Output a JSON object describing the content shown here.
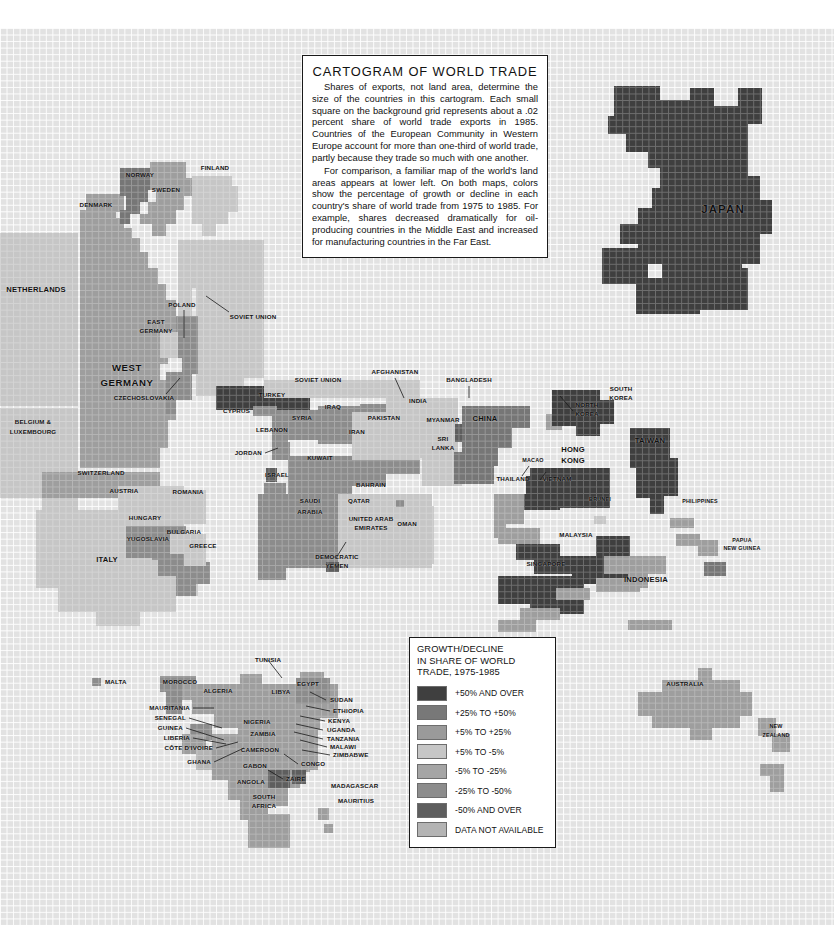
{
  "figure": {
    "kind": "cartogram",
    "background_color": "#c9c9c9",
    "grid_line_color": "#ffffff"
  },
  "description": {
    "title": "CARTOGRAM OF WORLD TRADE",
    "paragraphs": [
      "Shares of exports, not land area, determine the size of the countries in this cartogram. Each small square on the background grid represents about a .02 percent share of world trade exports in 1985. Countries of the European Community in Western Europe account for more than one-third of world trade, partly because they trade so much with one another.",
      "For comparison, a familiar map of the world's land areas appears at lower left. On both maps, colors show the percentage of growth or decline in each country's share of world trade from 1975 to 1985. For example, shares decreased dramatically for oil-producing countries in the Middle East and increased for manufacturing countries in the Far East."
    ]
  },
  "legend": {
    "title_lines": [
      "GROWTH/DECLINE",
      "IN SHARE OF WORLD",
      "TRADE, 1975-1985"
    ],
    "items": [
      {
        "label": "+50% AND OVER",
        "color": "#3f3f3f"
      },
      {
        "label": "+25% TO +50%",
        "color": "#787878"
      },
      {
        "label": "+5% TO +25%",
        "color": "#9a9a9a"
      },
      {
        "label": "+5% TO -5%",
        "color": "#c6c6c6"
      },
      {
        "label": "-5% TO -25%",
        "color": "#a5a5a5"
      },
      {
        "label": "-25% TO -50%",
        "color": "#8c8c8c"
      },
      {
        "label": "-50% AND OVER",
        "color": "#5e5e5e"
      },
      {
        "label": "DATA NOT AVAILABLE",
        "color": "#b4b4b4"
      }
    ]
  },
  "chart_data": {
    "type": "cartogram",
    "title": "CARTOGRAM OF WORLD TRADE",
    "units": "one background grid square ≈ .02 percent share of world trade exports, 1985",
    "period": "1975-1985",
    "legend_position": "center-bottom",
    "classes": [
      "+50% AND OVER",
      "+25% TO +50%",
      "+5% TO +25%",
      "+5% TO -5%",
      "-5% TO -25%",
      "-25% TO -50%",
      "-50% AND OVER",
      "DATA NOT AVAILABLE"
    ],
    "regions": [
      {
        "name": "NETHERLANDS",
        "class": "+5% TO -5%"
      },
      {
        "name": "BELGIUM & LUXEMBOURG",
        "class": "+5% TO -5%"
      },
      {
        "name": "WEST GERMANY",
        "class": "+5% TO -5%"
      },
      {
        "name": "EAST GERMANY",
        "class": "+5% TO -5%"
      },
      {
        "name": "DENMARK",
        "class": "+5% TO -5%"
      },
      {
        "name": "NORWAY",
        "class": "+25% TO +50%"
      },
      {
        "name": "SWEDEN",
        "class": "+5% TO -5%"
      },
      {
        "name": "FINLAND",
        "class": "+5% TO -5%"
      },
      {
        "name": "POLAND",
        "class": "-25% TO -50%"
      },
      {
        "name": "CZECHOSLOVAKIA",
        "class": "-25% TO -50%"
      },
      {
        "name": "SOVIET UNION",
        "class": "+5% TO -5%"
      },
      {
        "name": "SWITZERLAND",
        "class": "+5% TO -5%"
      },
      {
        "name": "AUSTRIA",
        "class": "+5% TO -5%"
      },
      {
        "name": "ITALY",
        "class": "+5% TO -5%"
      },
      {
        "name": "YUGOSLAVIA",
        "class": "+5% TO -5%"
      },
      {
        "name": "HUNGARY",
        "class": "-25% TO -50%"
      },
      {
        "name": "ROMANIA",
        "class": "+5% TO -5%"
      },
      {
        "name": "BULGARIA",
        "class": "+5% TO -5%"
      },
      {
        "name": "GREECE",
        "class": "-25% TO -50%"
      },
      {
        "name": "TURKEY",
        "class": "+50% AND OVER"
      },
      {
        "name": "CYPRUS",
        "class": "-25% TO -50%"
      },
      {
        "name": "SYRIA",
        "class": "-25% TO -50%"
      },
      {
        "name": "LEBANON",
        "class": "-25% TO -50%"
      },
      {
        "name": "JORDAN",
        "class": "-50% AND OVER"
      },
      {
        "name": "ISRAEL",
        "class": "-25% TO -50%"
      },
      {
        "name": "IRAQ",
        "class": "-25% TO -50%"
      },
      {
        "name": "IRAN",
        "class": "-25% TO -50%"
      },
      {
        "name": "KUWAIT",
        "class": "-25% TO -50%"
      },
      {
        "name": "SAUDI ARABIA",
        "class": "-25% TO -50%"
      },
      {
        "name": "QATAR",
        "class": "+5% TO -5%"
      },
      {
        "name": "BAHRAIN",
        "class": "+5% TO -5%"
      },
      {
        "name": "UNITED ARAB EMIRATES",
        "class": "+5% TO -5%"
      },
      {
        "name": "OMAN",
        "class": "+5% TO -5%"
      },
      {
        "name": "DEMOCRATIC YEMEN",
        "class": "-50% AND OVER"
      },
      {
        "name": "AFGHANISTAN",
        "class": "+5% TO -5%"
      },
      {
        "name": "PAKISTAN",
        "class": "+5% TO -5%"
      },
      {
        "name": "INDIA",
        "class": "+5% TO -5%"
      },
      {
        "name": "BANGLADESH",
        "class": "-50% AND OVER"
      },
      {
        "name": "SRI LANKA",
        "class": "+5% TO -5%"
      },
      {
        "name": "MYANMAR",
        "class": "-50% AND OVER"
      },
      {
        "name": "CHINA",
        "class": "+25% TO +50%"
      },
      {
        "name": "NORTH KOREA",
        "class": "+5% TO +25%"
      },
      {
        "name": "SOUTH KOREA",
        "class": "+50% AND OVER"
      },
      {
        "name": "JAPAN",
        "class": "+50% AND OVER"
      },
      {
        "name": "TAIWAN",
        "class": "+50% AND OVER"
      },
      {
        "name": "HONG KONG",
        "class": "+50% AND OVER"
      },
      {
        "name": "MACAO",
        "class": "+50% AND OVER"
      },
      {
        "name": "VIETNAM",
        "class": "+50% AND OVER"
      },
      {
        "name": "THAILAND",
        "class": "+5% TO +25%"
      },
      {
        "name": "MALAYSIA",
        "class": "+50% AND OVER"
      },
      {
        "name": "SINGAPORE",
        "class": "+50% AND OVER"
      },
      {
        "name": "BRUNEI",
        "class": "+5% TO -5%"
      },
      {
        "name": "INDONESIA",
        "class": "+5% TO +25%"
      },
      {
        "name": "PHILIPPINES",
        "class": "+5% TO +25%"
      },
      {
        "name": "PAPUA NEW GUINEA",
        "class": "+5% TO +25%"
      },
      {
        "name": "AUSTRALIA",
        "class": "+5% TO +25%"
      },
      {
        "name": "NEW ZEALAND",
        "class": "+5% TO +25%"
      },
      {
        "name": "MALTA",
        "class": "-25% TO -50%"
      },
      {
        "name": "MOROCCO",
        "class": "-25% TO -50%"
      },
      {
        "name": "ALGERIA",
        "class": "+5% TO +25%"
      },
      {
        "name": "TUNISIA",
        "class": "+5% TO +25%"
      },
      {
        "name": "LIBYA",
        "class": "+5% TO +25%"
      },
      {
        "name": "EGYPT",
        "class": "+5% TO +25%"
      },
      {
        "name": "SUDAN",
        "class": "+5% TO +25%"
      },
      {
        "name": "ETHIOPIA",
        "class": "+5% TO +25%"
      },
      {
        "name": "KENYA",
        "class": "+5% TO +25%"
      },
      {
        "name": "UGANDA",
        "class": "+5% TO +25%"
      },
      {
        "name": "TANZANIA",
        "class": "+5% TO +25%"
      },
      {
        "name": "MALAWI",
        "class": "-25% TO -50%"
      },
      {
        "name": "ZIMBABWE",
        "class": "-50% AND OVER"
      },
      {
        "name": "ZAMBIA",
        "class": "+5% TO +25%"
      },
      {
        "name": "CONGO",
        "class": "-50% AND OVER"
      },
      {
        "name": "ZAIRE",
        "class": "+5% TO +25%"
      },
      {
        "name": "ANGOLA",
        "class": "+5% TO +25%"
      },
      {
        "name": "GABON",
        "class": "+5% TO +25%"
      },
      {
        "name": "CAMEROON",
        "class": "+5% TO +25%"
      },
      {
        "name": "NIGERIA",
        "class": "+5% TO +25%"
      },
      {
        "name": "GHANA",
        "class": "+5% TO +25%"
      },
      {
        "name": "CÔTE D'IVOIRE",
        "class": "+5% TO +25%"
      },
      {
        "name": "LIBERIA",
        "class": "+5% TO +25%"
      },
      {
        "name": "GUINEA",
        "class": "+5% TO +25%"
      },
      {
        "name": "SENEGAL",
        "class": "-25% TO -50%"
      },
      {
        "name": "MAURITANIA",
        "class": "+5% TO +25%"
      },
      {
        "name": "SOUTH AFRICA",
        "class": "+5% TO +25%"
      },
      {
        "name": "MADAGASCAR",
        "class": "+5% TO +25%"
      },
      {
        "name": "MAURITIUS",
        "class": "+5% TO +25%"
      }
    ]
  },
  "map_labels": [
    {
      "text": "NETHERLANDS",
      "x": 36,
      "y": 290,
      "size": "md",
      "align": "c"
    },
    {
      "text": "BELGIUM &",
      "x": 33,
      "y": 422,
      "size": "sm",
      "align": "c"
    },
    {
      "text": "LUXEMBOURG",
      "x": 33,
      "y": 432,
      "size": "sm",
      "align": "c"
    },
    {
      "text": "DENMARK",
      "x": 96,
      "y": 205,
      "size": "sm",
      "align": "c"
    },
    {
      "text": "NORWAY",
      "x": 140,
      "y": 175,
      "size": "sm",
      "align": "c"
    },
    {
      "text": "SWEDEN",
      "x": 166,
      "y": 190,
      "size": "sm",
      "align": "c"
    },
    {
      "text": "FINLAND",
      "x": 215,
      "y": 168,
      "size": "sm",
      "align": "c"
    },
    {
      "text": "POLAND",
      "x": 182,
      "y": 305,
      "size": "sm",
      "align": "c"
    },
    {
      "text": "EAST",
      "x": 156,
      "y": 322,
      "size": "sm",
      "align": "c"
    },
    {
      "text": "GERMANY",
      "x": 156,
      "y": 331,
      "size": "sm",
      "align": "c"
    },
    {
      "text": "SOVIET UNION",
      "x": 253,
      "y": 317,
      "size": "sm",
      "align": "c"
    },
    {
      "text": "WEST",
      "x": 127,
      "y": 368,
      "size": "lg",
      "align": "c"
    },
    {
      "text": "GERMANY",
      "x": 127,
      "y": 383,
      "size": "lg",
      "align": "c"
    },
    {
      "text": "CZECHOSLOVAKIA",
      "x": 144,
      "y": 398,
      "size": "sm",
      "align": "c"
    },
    {
      "text": "SWITZERLAND",
      "x": 101,
      "y": 473,
      "size": "sm",
      "align": "c"
    },
    {
      "text": "AUSTRIA",
      "x": 124,
      "y": 491,
      "size": "sm",
      "align": "c"
    },
    {
      "text": "ROMANIA",
      "x": 188,
      "y": 492,
      "size": "sm",
      "align": "c"
    },
    {
      "text": "HUNGARY",
      "x": 145,
      "y": 518,
      "size": "sm",
      "align": "c"
    },
    {
      "text": "BULGARIA",
      "x": 184,
      "y": 532,
      "size": "sm",
      "align": "c"
    },
    {
      "text": "YUGOSLAVIA",
      "x": 148,
      "y": 539,
      "size": "sm",
      "align": "c"
    },
    {
      "text": "GREECE",
      "x": 203,
      "y": 546,
      "size": "sm",
      "align": "c"
    },
    {
      "text": "ITALY",
      "x": 107,
      "y": 560,
      "size": "md",
      "align": "c"
    },
    {
      "text": "TURKEY",
      "x": 272,
      "y": 395,
      "size": "sm",
      "align": "c"
    },
    {
      "text": "SOVIET UNION",
      "x": 318,
      "y": 380,
      "size": "sm",
      "align": "c"
    },
    {
      "text": "AFGHANISTAN",
      "x": 395,
      "y": 372,
      "size": "sm",
      "align": "c"
    },
    {
      "text": "BANGLADESH",
      "x": 469,
      "y": 380,
      "size": "sm",
      "align": "c"
    },
    {
      "text": "CYPRUS",
      "x": 250,
      "y": 411,
      "size": "sm",
      "align": "r"
    },
    {
      "text": "IRAQ",
      "x": 333,
      "y": 407,
      "size": "sm",
      "align": "c"
    },
    {
      "text": "INDIA",
      "x": 418,
      "y": 401,
      "size": "sm",
      "align": "c"
    },
    {
      "text": "SYRIA",
      "x": 302,
      "y": 418,
      "size": "sm",
      "align": "c"
    },
    {
      "text": "PAKISTAN",
      "x": 384,
      "y": 418,
      "size": "sm",
      "align": "c"
    },
    {
      "text": "NORTH",
      "x": 587,
      "y": 405,
      "size": "sm",
      "align": "c"
    },
    {
      "text": "KOREA",
      "x": 587,
      "y": 414,
      "size": "sm",
      "align": "c"
    },
    {
      "text": "SOUTH",
      "x": 621,
      "y": 389,
      "size": "sm",
      "align": "c"
    },
    {
      "text": "KOREA",
      "x": 621,
      "y": 398,
      "size": "sm",
      "align": "c"
    },
    {
      "text": "MYANMAR",
      "x": 443,
      "y": 420,
      "size": "sm",
      "align": "c"
    },
    {
      "text": "CHINA",
      "x": 485,
      "y": 419,
      "size": "md",
      "align": "c"
    },
    {
      "text": "LEBANON",
      "x": 272,
      "y": 430,
      "size": "sm",
      "align": "c"
    },
    {
      "text": "IRAN",
      "x": 357,
      "y": 432,
      "size": "sm",
      "align": "c"
    },
    {
      "text": "SRI",
      "x": 443,
      "y": 439,
      "size": "sm",
      "align": "c"
    },
    {
      "text": "LANKA",
      "x": 443,
      "y": 448,
      "size": "sm",
      "align": "c"
    },
    {
      "text": "HONG",
      "x": 573,
      "y": 450,
      "size": "md",
      "align": "c"
    },
    {
      "text": "KONG",
      "x": 573,
      "y": 461,
      "size": "md",
      "align": "c"
    },
    {
      "text": "TAIWAN",
      "x": 650,
      "y": 441,
      "size": "md",
      "align": "c"
    },
    {
      "text": "JORDAN",
      "x": 262,
      "y": 453,
      "size": "sm",
      "align": "r"
    },
    {
      "text": "KUWAIT",
      "x": 320,
      "y": 458,
      "size": "sm",
      "align": "c"
    },
    {
      "text": "MACAO",
      "x": 533,
      "y": 461,
      "size": "xs",
      "align": "c"
    },
    {
      "text": "ISRAEL",
      "x": 277,
      "y": 475,
      "size": "sm",
      "align": "c"
    },
    {
      "text": "THAILAND",
      "x": 513,
      "y": 479,
      "size": "sm",
      "align": "c"
    },
    {
      "text": "VIETNAM",
      "x": 557,
      "y": 479,
      "size": "sm",
      "align": "c"
    },
    {
      "text": "BAHRAIN",
      "x": 371,
      "y": 485,
      "size": "sm",
      "align": "c"
    },
    {
      "text": "SAUDI",
      "x": 310,
      "y": 501,
      "size": "sm",
      "align": "c"
    },
    {
      "text": "ARABIA",
      "x": 310,
      "y": 512,
      "size": "sm",
      "align": "c"
    },
    {
      "text": "QATAR",
      "x": 359,
      "y": 501,
      "size": "sm",
      "align": "c"
    },
    {
      "text": "BRUNEI",
      "x": 600,
      "y": 500,
      "size": "xs",
      "align": "c"
    },
    {
      "text": "PHILIPPINES",
      "x": 700,
      "y": 502,
      "size": "xs",
      "align": "c"
    },
    {
      "text": "UNITED ARAB",
      "x": 371,
      "y": 519,
      "size": "sm",
      "align": "c"
    },
    {
      "text": "EMIRATES",
      "x": 371,
      "y": 528,
      "size": "sm",
      "align": "c"
    },
    {
      "text": "OMAN",
      "x": 407,
      "y": 524,
      "size": "sm",
      "align": "c"
    },
    {
      "text": "MALAYSIA",
      "x": 576,
      "y": 535,
      "size": "sm",
      "align": "c"
    },
    {
      "text": "PAPUA",
      "x": 742,
      "y": 541,
      "size": "xs",
      "align": "c"
    },
    {
      "text": "NEW GUINEA",
      "x": 742,
      "y": 549,
      "size": "xs",
      "align": "c"
    },
    {
      "text": "DEMOCRATIC",
      "x": 337,
      "y": 557,
      "size": "sm",
      "align": "c"
    },
    {
      "text": "YEMEN",
      "x": 337,
      "y": 566,
      "size": "sm",
      "align": "c"
    },
    {
      "text": "SINGAPORE",
      "x": 546,
      "y": 564,
      "size": "sm",
      "align": "c"
    },
    {
      "text": "INDONESIA",
      "x": 646,
      "y": 580,
      "size": "md",
      "align": "c"
    },
    {
      "text": "MALTA",
      "x": 105,
      "y": 682,
      "size": "sm",
      "align": "l"
    },
    {
      "text": "TUNISIA",
      "x": 268,
      "y": 660,
      "size": "sm",
      "align": "c"
    },
    {
      "text": "MOROCCO",
      "x": 180,
      "y": 682,
      "size": "sm",
      "align": "c"
    },
    {
      "text": "ALGERIA",
      "x": 218,
      "y": 691,
      "size": "sm",
      "align": "c"
    },
    {
      "text": "LIBYA",
      "x": 281,
      "y": 692,
      "size": "sm",
      "align": "c"
    },
    {
      "text": "EGYPT",
      "x": 308,
      "y": 684,
      "size": "sm",
      "align": "c"
    },
    {
      "text": "AUSTRALIA",
      "x": 685,
      "y": 684,
      "size": "sm",
      "align": "c"
    },
    {
      "text": "SUDAN",
      "x": 330,
      "y": 700,
      "size": "sm",
      "align": "l"
    },
    {
      "text": "MAURITANIA",
      "x": 190,
      "y": 708,
      "size": "sm",
      "align": "r"
    },
    {
      "text": "ETHIOPIA",
      "x": 333,
      "y": 711,
      "size": "sm",
      "align": "l"
    },
    {
      "text": "SENEGAL",
      "x": 186,
      "y": 718,
      "size": "sm",
      "align": "r"
    },
    {
      "text": "KENYA",
      "x": 328,
      "y": 721,
      "size": "sm",
      "align": "l"
    },
    {
      "text": "NIGERIA",
      "x": 257,
      "y": 722,
      "size": "sm",
      "align": "c"
    },
    {
      "text": "UGANDA",
      "x": 327,
      "y": 730,
      "size": "sm",
      "align": "l"
    },
    {
      "text": "GUINEA",
      "x": 183,
      "y": 728,
      "size": "sm",
      "align": "r"
    },
    {
      "text": "TANZANIA",
      "x": 327,
      "y": 739,
      "size": "sm",
      "align": "l"
    },
    {
      "text": "ZAMBIA",
      "x": 263,
      "y": 734,
      "size": "sm",
      "align": "c"
    },
    {
      "text": "LIBERIA",
      "x": 190,
      "y": 738,
      "size": "sm",
      "align": "r"
    },
    {
      "text": "MALAWI",
      "x": 330,
      "y": 747,
      "size": "sm",
      "align": "l"
    },
    {
      "text": "NEW",
      "x": 776,
      "y": 727,
      "size": "xs",
      "align": "c"
    },
    {
      "text": "ZEALAND",
      "x": 776,
      "y": 736,
      "size": "xs",
      "align": "c"
    },
    {
      "text": "CÔTE D'IVOIRE",
      "x": 213,
      "y": 748,
      "size": "sm",
      "align": "r"
    },
    {
      "text": "CAMEROON",
      "x": 260,
      "y": 750,
      "size": "sm",
      "align": "c"
    },
    {
      "text": "ZIMBABWE",
      "x": 333,
      "y": 755,
      "size": "sm",
      "align": "l"
    },
    {
      "text": "GHANA",
      "x": 211,
      "y": 762,
      "size": "sm",
      "align": "r"
    },
    {
      "text": "CONGO",
      "x": 301,
      "y": 764,
      "size": "sm",
      "align": "l"
    },
    {
      "text": "GABON",
      "x": 255,
      "y": 766,
      "size": "sm",
      "align": "c"
    },
    {
      "text": "ZAIRE",
      "x": 286,
      "y": 779,
      "size": "sm",
      "align": "l"
    },
    {
      "text": "ANGOLA",
      "x": 251,
      "y": 782,
      "size": "sm",
      "align": "c"
    },
    {
      "text": "MADAGASCAR",
      "x": 331,
      "y": 786,
      "size": "sm",
      "align": "l"
    },
    {
      "text": "SOUTH",
      "x": 264,
      "y": 797,
      "size": "sm",
      "align": "c"
    },
    {
      "text": "AFRICA",
      "x": 264,
      "y": 806,
      "size": "sm",
      "align": "c"
    },
    {
      "text": "MAURITIUS",
      "x": 338,
      "y": 801,
      "size": "sm",
      "align": "l"
    },
    {
      "text": "JAPAN",
      "x": 723,
      "y": 210,
      "size": "xl",
      "align": "c"
    }
  ]
}
